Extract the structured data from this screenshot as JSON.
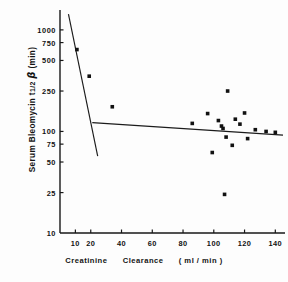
{
  "chart_data": {
    "type": "scatter",
    "title": "",
    "xlabel": "Creatinine Clearance (ml/min)",
    "ylabel": "Serum Bleomycin t1/2 beta (min)",
    "ylabel_parts": {
      "prefix": "Serum  Bleomycin",
      "symbol": "t",
      "fraction": "1/2",
      "greek": "β",
      "units": "(min)"
    },
    "xlabel_parts": {
      "word1": "Creatinine",
      "word2": "Clearance",
      "units": "( ml / min )"
    },
    "xscale": "linear",
    "yscale": "log",
    "xlim": [
      0,
      145
    ],
    "ylim": [
      10,
      1500
    ],
    "grid": false,
    "legend": null,
    "xticks": [
      10,
      20,
      40,
      60,
      80,
      100,
      120,
      140
    ],
    "xtick_labels": [
      "10",
      "20",
      "40",
      "60",
      "80",
      "100",
      "120",
      "140"
    ],
    "yticks": [
      25,
      50,
      75,
      100,
      250,
      500,
      750,
      1000
    ],
    "ytick_labels": [
      "25",
      "50",
      "75",
      "100",
      "250",
      "500",
      "750",
      "1000"
    ],
    "y_axis_bottom_label": "10",
    "marker": "filled-square",
    "marker_color": "#111111",
    "marker_size_px": 3.6,
    "points": [
      {
        "x": 11,
        "y": 640
      },
      {
        "x": 19,
        "y": 350
      },
      {
        "x": 34,
        "y": 175
      },
      {
        "x": 86,
        "y": 120
      },
      {
        "x": 96,
        "y": 150
      },
      {
        "x": 99,
        "y": 62
      },
      {
        "x": 103,
        "y": 128
      },
      {
        "x": 105,
        "y": 113
      },
      {
        "x": 106,
        "y": 107
      },
      {
        "x": 107,
        "y": 24
      },
      {
        "x": 108,
        "y": 88
      },
      {
        "x": 109,
        "y": 250
      },
      {
        "x": 112,
        "y": 73
      },
      {
        "x": 114,
        "y": 132
      },
      {
        "x": 117,
        "y": 118
      },
      {
        "x": 120,
        "y": 152
      },
      {
        "x": 122,
        "y": 85
      },
      {
        "x": 127,
        "y": 104
      },
      {
        "x": 134,
        "y": 100
      },
      {
        "x": 140,
        "y": 98
      }
    ],
    "lines": [
      {
        "name": "steep-regression-line",
        "x0": 5.5,
        "y0": 1430,
        "x1": 24.5,
        "y1": 57
      },
      {
        "name": "shallow-regression-line",
        "x0": 21,
        "y0": 122,
        "x1": 145,
        "y1": 92
      }
    ]
  }
}
